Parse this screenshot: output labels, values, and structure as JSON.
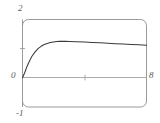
{
  "figure": {
    "kind": "mathematica-style-frame-plot",
    "background_color": "#ffffff",
    "frame_color": "#9a9a9a",
    "axis_color": "#a8a8a8",
    "curve_color": "#3a3a3a",
    "label_color": "#5a5a5a"
  },
  "labels": {
    "y_max": "2",
    "y_zero": "0",
    "y_min": "-1",
    "x_max": "8"
  },
  "chart_data": {
    "type": "line",
    "title": "",
    "xlabel": "",
    "ylabel": "",
    "xlim": [
      0,
      8
    ],
    "ylim": [
      -1,
      2
    ],
    "grid": false,
    "legend": null,
    "x_ticks": [
      0,
      4,
      8
    ],
    "x_tick_labels": [
      "0",
      "",
      "8"
    ],
    "y_ticks": [
      -1,
      0,
      1,
      2
    ],
    "y_tick_labels": [
      "-1",
      "0",
      "",
      "2"
    ],
    "zero_line": 0,
    "series": [
      {
        "name": "curve",
        "x": [
          0.0,
          0.1,
          0.2,
          0.3,
          0.4,
          0.5,
          0.6,
          0.8,
          1.0,
          1.2,
          1.4,
          1.6,
          1.8,
          2.0,
          2.2,
          2.4,
          2.6,
          2.8,
          3.0,
          3.5,
          4.0,
          4.5,
          5.0,
          5.5,
          6.0,
          6.5,
          7.0,
          7.5,
          8.0
        ],
        "y": [
          0.0,
          0.12,
          0.26,
          0.4,
          0.52,
          0.63,
          0.73,
          0.88,
          1.0,
          1.08,
          1.14,
          1.18,
          1.21,
          1.23,
          1.245,
          1.25,
          1.25,
          1.25,
          1.248,
          1.238,
          1.227,
          1.214,
          1.2,
          1.186,
          1.172,
          1.158,
          1.144,
          1.131,
          1.118
        ]
      }
    ]
  }
}
